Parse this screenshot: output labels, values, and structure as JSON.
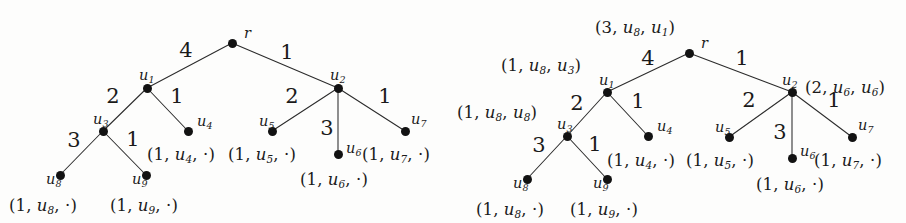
{
  "figure": {
    "background_color": "#fdfdfc",
    "ink_color": "#1a1a1a",
    "node_color": "#121212",
    "edge_color": "#2b2b2b"
  },
  "panels": [
    {
      "id": "left",
      "name": "left-tree",
      "nodes": [
        {
          "id": "r",
          "label": "r",
          "sub": "",
          "x": 232,
          "y": 43,
          "name_dx": 12,
          "name_dy": -17
        },
        {
          "id": "u1",
          "label": "u",
          "sub": "1",
          "x": 147,
          "y": 88,
          "name_dx": -8,
          "name_dy": -20
        },
        {
          "id": "u2",
          "label": "u",
          "sub": "2",
          "x": 338,
          "y": 88,
          "name_dx": -8,
          "name_dy": -20
        },
        {
          "id": "u3",
          "label": "u",
          "sub": "3",
          "x": 103,
          "y": 131,
          "name_dx": -10,
          "name_dy": -19
        },
        {
          "id": "u4",
          "label": "u",
          "sub": "4",
          "x": 188,
          "y": 131,
          "name_dx": 9,
          "name_dy": -17
        },
        {
          "id": "u5",
          "label": "u",
          "sub": "5",
          "x": 272,
          "y": 131,
          "name_dx": -13,
          "name_dy": -17
        },
        {
          "id": "u6",
          "label": "u",
          "sub": "6",
          "x": 338,
          "y": 154,
          "name_dx": 8,
          "name_dy": -13
        },
        {
          "id": "u7",
          "label": "u",
          "sub": "7",
          "x": 405,
          "y": 131,
          "name_dx": 6,
          "name_dy": -19
        },
        {
          "id": "u8",
          "label": "u",
          "sub": "8",
          "x": 60,
          "y": 175,
          "name_dx": -14,
          "name_dy": -3
        },
        {
          "id": "u9",
          "label": "u",
          "sub": "9",
          "x": 146,
          "y": 175,
          "name_dx": -14,
          "name_dy": -3
        }
      ],
      "edges": [
        {
          "from": "r",
          "to": "u1",
          "weight": "4",
          "wx": 186,
          "wy": 50
        },
        {
          "from": "r",
          "to": "u2",
          "weight": "1",
          "wx": 287,
          "wy": 52
        },
        {
          "from": "u1",
          "to": "u3",
          "weight": "2",
          "wx": 113,
          "wy": 96
        },
        {
          "from": "u1",
          "to": "u4",
          "weight": "1",
          "wx": 177,
          "wy": 96
        },
        {
          "from": "u2",
          "to": "u5",
          "weight": "2",
          "wx": 292,
          "wy": 96
        },
        {
          "from": "u2",
          "to": "u6",
          "weight": "3",
          "wx": 327,
          "wy": 128
        },
        {
          "from": "u2",
          "to": "u7",
          "weight": "1",
          "wx": 385,
          "wy": 96
        },
        {
          "from": "u3",
          "to": "u8",
          "weight": "3",
          "wx": 74,
          "wy": 140
        },
        {
          "from": "u3",
          "to": "u9",
          "weight": "1",
          "wx": 133,
          "wy": 139
        }
      ],
      "annotations": [
        {
          "text": "(1, u4, ·)",
          "v": "u",
          "sub": "4",
          "num": "1",
          "third": "·",
          "x": 147,
          "y": 147,
          "align": "left"
        },
        {
          "text": "(1, u5, ·)",
          "v": "u",
          "sub": "5",
          "num": "1",
          "third": "·",
          "x": 228,
          "y": 147,
          "align": "left"
        },
        {
          "text": "(1, u6, ·)",
          "v": "u",
          "sub": "6",
          "num": "1",
          "third": "·",
          "x": 300,
          "y": 172,
          "align": "left"
        },
        {
          "text": "(1, u7, ·)",
          "v": "u",
          "sub": "7",
          "num": "1",
          "third": "·",
          "x": 362,
          "y": 147,
          "align": "left"
        },
        {
          "text": "(1, u8, ·)",
          "v": "u",
          "sub": "8",
          "num": "1",
          "third": "·",
          "x": 9,
          "y": 198,
          "align": "left"
        },
        {
          "text": "(1, u9, ·)",
          "v": "u",
          "sub": "9",
          "num": "1",
          "third": "·",
          "x": 110,
          "y": 198,
          "align": "left"
        }
      ]
    },
    {
      "id": "right",
      "name": "right-tree",
      "nodes": [
        {
          "id": "r",
          "label": "r",
          "sub": "",
          "x": 236,
          "y": 53,
          "name_dx": 12,
          "name_dy": -17
        },
        {
          "id": "u1",
          "label": "u",
          "sub": "1",
          "x": 154,
          "y": 92,
          "name_dx": -8,
          "name_dy": -19
        },
        {
          "id": "u2",
          "label": "u",
          "sub": "2",
          "x": 339,
          "y": 92,
          "name_dx": -10,
          "name_dy": -19
        },
        {
          "id": "u3",
          "label": "u",
          "sub": "3",
          "x": 114,
          "y": 136,
          "name_dx": -10,
          "name_dy": -19
        },
        {
          "id": "u4",
          "label": "u",
          "sub": "4",
          "x": 195,
          "y": 136,
          "name_dx": 9,
          "name_dy": -17
        },
        {
          "id": "u5",
          "label": "u",
          "sub": "5",
          "x": 276,
          "y": 137,
          "name_dx": -14,
          "name_dy": -17
        },
        {
          "id": "u6",
          "label": "u",
          "sub": "6",
          "x": 339,
          "y": 158,
          "name_dx": 8,
          "name_dy": -14
        },
        {
          "id": "u7",
          "label": "u",
          "sub": "7",
          "x": 399,
          "y": 137,
          "name_dx": 6,
          "name_dy": -19
        },
        {
          "id": "u8",
          "label": "u",
          "sub": "8",
          "x": 74,
          "y": 179,
          "name_dx": -14,
          "name_dy": -3
        },
        {
          "id": "u9",
          "label": "u",
          "sub": "9",
          "x": 154,
          "y": 179,
          "name_dx": -14,
          "name_dy": -3
        }
      ],
      "edges": [
        {
          "from": "r",
          "to": "u1",
          "weight": "4",
          "wx": 195,
          "wy": 58
        },
        {
          "from": "r",
          "to": "u2",
          "weight": "1",
          "wx": 289,
          "wy": 58
        },
        {
          "from": "u1",
          "to": "u3",
          "weight": "2",
          "wx": 124,
          "wy": 103
        },
        {
          "from": "u1",
          "to": "u4",
          "weight": "1",
          "wx": 185,
          "wy": 101
        },
        {
          "from": "u2",
          "to": "u5",
          "weight": "2",
          "wx": 296,
          "wy": 100
        },
        {
          "from": "u2",
          "to": "u6",
          "weight": "3",
          "wx": 327,
          "wy": 132
        },
        {
          "from": "u2",
          "to": "u7",
          "weight": "1",
          "wx": 381,
          "wy": 100
        },
        {
          "from": "u3",
          "to": "u8",
          "weight": "3",
          "wx": 86,
          "wy": 145
        },
        {
          "from": "u3",
          "to": "u9",
          "weight": "1",
          "wx": 142,
          "wy": 144
        }
      ],
      "annotations": [
        {
          "text": "(3, u8, u1)",
          "v": "u",
          "sub": "8",
          "num": "3",
          "third": "u",
          "third_sub": "1",
          "x": 142,
          "y": 20,
          "align": "left"
        },
        {
          "text": "(1, u8, u3)",
          "v": "u",
          "sub": "8",
          "num": "1",
          "third": "u",
          "third_sub": "3",
          "x": 48,
          "y": 58,
          "align": "left"
        },
        {
          "text": "(2, u6, u6)",
          "v": "u",
          "sub": "6",
          "num": "2",
          "third": "u",
          "third_sub": "6",
          "x": 352,
          "y": 80,
          "align": "left"
        },
        {
          "text": "(1, u8, u8)",
          "v": "u",
          "sub": "8",
          "num": "1",
          "third": "u",
          "third_sub": "8",
          "x": 4,
          "y": 105,
          "align": "left"
        },
        {
          "text": "(1, u4, ·)",
          "v": "u",
          "sub": "4",
          "num": "1",
          "third": "·",
          "x": 154,
          "y": 153,
          "align": "left"
        },
        {
          "text": "(1, u5, ·)",
          "v": "u",
          "sub": "5",
          "num": "1",
          "third": "·",
          "x": 233,
          "y": 153,
          "align": "left"
        },
        {
          "text": "(1, u6, ·)",
          "v": "u",
          "sub": "6",
          "num": "1",
          "third": "·",
          "x": 303,
          "y": 177,
          "align": "left"
        },
        {
          "text": "(1, u7, ·)",
          "v": "u",
          "sub": "7",
          "num": "1",
          "third": "·",
          "x": 361,
          "y": 153,
          "align": "left"
        },
        {
          "text": "(1, u8, ·)",
          "v": "u",
          "sub": "8",
          "num": "1",
          "third": "·",
          "x": 23,
          "y": 202,
          "align": "left"
        },
        {
          "text": "(1, u9, ·)",
          "v": "u",
          "sub": "9",
          "num": "1",
          "third": "·",
          "x": 117,
          "y": 202,
          "align": "left"
        }
      ]
    }
  ]
}
